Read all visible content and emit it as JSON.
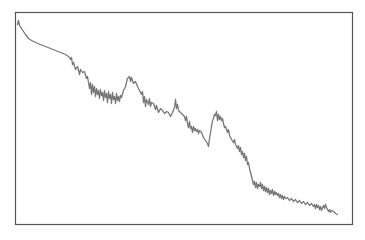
{
  "chart_data": {
    "type": "line",
    "title": "",
    "xlabel": "",
    "ylabel": "",
    "legend": [],
    "grid": false,
    "axes_visible": false,
    "frame": {
      "x": 15.5,
      "y": 12.5,
      "width": 337,
      "height": 212,
      "stroke": "#555555"
    },
    "line_color": "#777777",
    "xlim": [
      0,
      337
    ],
    "ylim": [
      0,
      212
    ],
    "series": [
      {
        "name": "series-1",
        "points": [
          [
            2,
            200
          ],
          [
            3,
            204
          ],
          [
            4,
            199
          ],
          [
            6,
            196
          ],
          [
            8,
            193
          ],
          [
            10,
            190
          ],
          [
            13,
            186
          ],
          [
            16,
            184
          ],
          [
            20,
            182
          ],
          [
            25,
            180
          ],
          [
            30,
            178
          ],
          [
            35,
            176
          ],
          [
            40,
            174
          ],
          [
            45,
            172
          ],
          [
            50,
            170
          ],
          [
            53,
            168
          ],
          [
            55,
            165
          ],
          [
            56,
            167
          ],
          [
            57,
            160
          ],
          [
            58,
            162
          ],
          [
            60,
            155
          ],
          [
            62,
            158
          ],
          [
            64,
            150
          ],
          [
            65,
            155
          ],
          [
            67,
            152
          ],
          [
            69,
            153
          ],
          [
            71,
            146
          ],
          [
            72,
            148
          ],
          [
            74,
            136
          ],
          [
            75,
            142
          ],
          [
            76,
            130
          ],
          [
            77,
            140
          ],
          [
            78,
            132
          ],
          [
            79,
            138
          ],
          [
            80,
            128
          ],
          [
            81,
            136
          ],
          [
            82,
            130
          ],
          [
            83,
            134
          ],
          [
            84,
            126
          ],
          [
            85,
            135
          ],
          [
            86,
            129
          ],
          [
            87,
            132
          ],
          [
            88,
            124
          ],
          [
            89,
            134
          ],
          [
            90,
            127
          ],
          [
            91,
            131
          ],
          [
            92,
            122
          ],
          [
            93,
            133
          ],
          [
            94,
            126
          ],
          [
            95,
            130
          ],
          [
            96,
            121
          ],
          [
            97,
            132
          ],
          [
            98,
            125
          ],
          [
            99,
            128
          ],
          [
            100,
            121
          ],
          [
            101,
            131
          ],
          [
            102,
            124
          ],
          [
            103,
            128
          ],
          [
            104,
            123
          ],
          [
            105,
            129
          ],
          [
            106,
            127
          ],
          [
            108,
            134
          ],
          [
            110,
            138
          ],
          [
            112,
            146
          ],
          [
            114,
            148
          ],
          [
            115,
            143
          ],
          [
            116,
            147
          ],
          [
            117,
            144
          ],
          [
            118,
            141
          ],
          [
            120,
            143
          ],
          [
            122,
            138
          ],
          [
            124,
            134
          ],
          [
            126,
            130
          ],
          [
            127,
            133
          ],
          [
            128,
            122
          ],
          [
            129,
            128
          ],
          [
            130,
            118
          ],
          [
            131,
            125
          ],
          [
            132,
            123
          ],
          [
            133,
            120
          ],
          [
            134,
            126
          ],
          [
            135,
            118
          ],
          [
            136,
            122
          ],
          [
            138,
            121
          ],
          [
            140,
            115
          ],
          [
            141,
            119
          ],
          [
            143,
            112
          ],
          [
            145,
            116
          ],
          [
            147,
            114
          ],
          [
            149,
            111
          ],
          [
            151,
            113
          ],
          [
            153,
            112
          ],
          [
            155,
            108
          ],
          [
            157,
            112
          ],
          [
            159,
            117
          ],
          [
            160,
            125
          ],
          [
            161,
            116
          ],
          [
            162,
            120
          ],
          [
            163,
            114
          ],
          [
            165,
            112
          ],
          [
            167,
            110
          ],
          [
            169,
            108
          ],
          [
            170,
            104
          ],
          [
            171,
            108
          ],
          [
            172,
            101
          ],
          [
            173,
            97
          ],
          [
            174,
            103
          ],
          [
            175,
            96
          ],
          [
            176,
            98
          ],
          [
            177,
            92
          ],
          [
            178,
            98
          ],
          [
            179,
            94
          ],
          [
            180,
            96
          ],
          [
            181,
            93
          ],
          [
            182,
            95
          ],
          [
            183,
            91
          ],
          [
            184,
            94
          ],
          [
            186,
            92
          ],
          [
            188,
            87
          ],
          [
            190,
            84
          ],
          [
            192,
            81
          ],
          [
            193,
            78
          ],
          [
            194,
            86
          ],
          [
            195,
            92
          ],
          [
            196,
            98
          ],
          [
            197,
            104
          ],
          [
            198,
            106
          ],
          [
            199,
            110
          ],
          [
            200,
            109
          ],
          [
            201,
            113
          ],
          [
            202,
            104
          ],
          [
            203,
            110
          ],
          [
            204,
            105
          ],
          [
            205,
            108
          ],
          [
            206,
            104
          ],
          [
            207,
            106
          ],
          [
            208,
            101
          ],
          [
            209,
            97
          ],
          [
            210,
            98
          ],
          [
            212,
            92
          ],
          [
            213,
            95
          ],
          [
            214,
            89
          ],
          [
            216,
            85
          ],
          [
            218,
            82
          ],
          [
            219,
            85
          ],
          [
            220,
            80
          ],
          [
            222,
            76
          ],
          [
            223,
            79
          ],
          [
            224,
            73
          ],
          [
            225,
            77
          ],
          [
            226,
            70
          ],
          [
            227,
            73
          ],
          [
            228,
            67
          ],
          [
            229,
            71
          ],
          [
            230,
            64
          ],
          [
            231,
            68
          ],
          [
            232,
            60
          ],
          [
            233,
            62
          ],
          [
            234,
            56
          ],
          [
            235,
            52
          ],
          [
            236,
            48
          ],
          [
            237,
            44
          ],
          [
            238,
            40
          ],
          [
            239,
            43
          ],
          [
            240,
            37
          ],
          [
            241,
            42
          ],
          [
            242,
            36
          ],
          [
            243,
            40
          ],
          [
            244,
            38
          ],
          [
            245,
            42
          ],
          [
            246,
            36
          ],
          [
            247,
            40
          ],
          [
            248,
            34
          ],
          [
            249,
            38
          ],
          [
            250,
            33
          ],
          [
            251,
            37
          ],
          [
            252,
            32
          ],
          [
            253,
            36
          ],
          [
            254,
            30
          ],
          [
            255,
            34
          ],
          [
            256,
            31
          ],
          [
            257,
            35
          ],
          [
            258,
            29
          ],
          [
            259,
            33
          ],
          [
            260,
            30
          ],
          [
            261,
            32
          ],
          [
            262,
            29
          ],
          [
            263,
            31
          ],
          [
            264,
            27
          ],
          [
            265,
            30
          ],
          [
            266,
            26
          ],
          [
            267,
            29
          ],
          [
            268,
            25
          ],
          [
            269,
            28
          ],
          [
            270,
            26
          ],
          [
            272,
            27
          ],
          [
            274,
            24
          ],
          [
            276,
            26
          ],
          [
            278,
            23
          ],
          [
            280,
            25
          ],
          [
            282,
            22
          ],
          [
            284,
            24
          ],
          [
            286,
            21
          ],
          [
            288,
            23
          ],
          [
            290,
            20
          ],
          [
            292,
            22
          ],
          [
            294,
            19
          ],
          [
            296,
            21
          ],
          [
            298,
            18
          ],
          [
            299,
            20
          ],
          [
            300,
            16
          ],
          [
            301,
            20
          ],
          [
            302,
            17
          ],
          [
            303,
            19
          ],
          [
            304,
            15
          ],
          [
            305,
            18
          ],
          [
            306,
            14
          ],
          [
            307,
            17
          ],
          [
            308,
            19
          ],
          [
            309,
            16
          ],
          [
            310,
            20
          ],
          [
            311,
            17
          ],
          [
            312,
            15
          ],
          [
            313,
            13
          ],
          [
            314,
            15
          ],
          [
            315,
            12
          ],
          [
            316,
            14
          ],
          [
            318,
            13
          ],
          [
            320,
            11
          ],
          [
            322,
            10
          ]
        ]
      }
    ]
  }
}
